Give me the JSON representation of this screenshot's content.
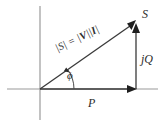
{
  "figure": {
    "colors": {
      "axis": "#8c8c8c",
      "vector": "#3a3a3a",
      "arc": "#4a4a4a",
      "text": "#2b2b2b",
      "background": "#ffffff"
    },
    "labels": {
      "apparent_power": "S",
      "reactive_power": "jQ",
      "real_power": "P",
      "angle": "ϕ",
      "magnitude_prefix": "|S| = |",
      "magnitude_v": "V",
      "magnitude_sep": "||",
      "magnitude_i": "I",
      "magnitude_suffix": "|",
      "magnitude_full": "|S| = |V||I|"
    },
    "axes": {
      "horizontal_label": "real-axis",
      "vertical_label": "imaginary-axis"
    },
    "geometry": {
      "origin_x": 40,
      "origin_y": 89,
      "tip_x": 136,
      "tip_y": 22,
      "p_arrow_end_x": 136,
      "q_arrow_top_y": 22,
      "angle_degrees": 35
    }
  }
}
